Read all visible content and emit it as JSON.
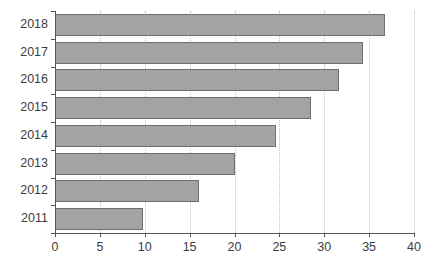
{
  "chart_data": {
    "type": "bar",
    "orientation": "horizontal",
    "title": "",
    "subtitle": "",
    "xlabel": "",
    "ylabel": "",
    "categories": [
      "2018",
      "2017",
      "2016",
      "2015",
      "2014",
      "2013",
      "2012",
      "2011"
    ],
    "values": [
      36.8,
      34.3,
      31.6,
      28.5,
      24.6,
      20.0,
      16.0,
      9.8
    ],
    "xlim": [
      0,
      40
    ],
    "xticks": [
      0,
      5,
      10,
      15,
      20,
      25,
      30,
      35,
      40
    ],
    "xtick_labels": [
      "0",
      "5",
      "10",
      "15",
      "20",
      "25",
      "30",
      "35",
      "40"
    ],
    "grid": "vertical-dotted",
    "legend": "none",
    "bar_fill_color": "#a3a3a3",
    "bar_edge_color": "#6e6e6e",
    "axis_color": "#555555",
    "gridline_color": "#bfbfbf",
    "background_color": "#ffffff"
  }
}
